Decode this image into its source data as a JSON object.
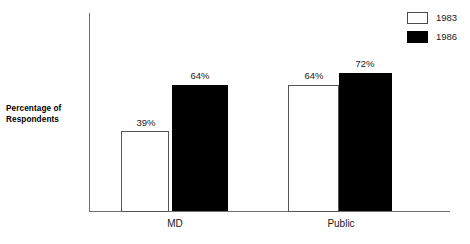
{
  "chart_data": {
    "type": "bar",
    "title": "",
    "subtitle": "",
    "xlabel": "",
    "ylabel": "Percentage of Respondents",
    "ylabel_line1": "Percentage of",
    "ylabel_line2": "Respondents",
    "categories": [
      "MD",
      "Public"
    ],
    "series": [
      {
        "name": "1983",
        "values": [
          39,
          64
        ],
        "value_labels": [
          "39%",
          "64%"
        ],
        "color": "#ffffff",
        "border_color": "#555555"
      },
      {
        "name": "1986",
        "values": [
          64,
          72
        ],
        "value_labels": [
          "64%",
          "72%"
        ],
        "color": "#000000",
        "border_color": "#000000"
      }
    ],
    "ylim": [
      0,
      100
    ],
    "grid": false,
    "legend_position": "top-right",
    "value_label_suffix": "%"
  },
  "axis": {
    "y_axis_name": "y-axis-line",
    "x_axis_name": "x-axis-line"
  },
  "legend": {
    "items": [
      {
        "label": "1983",
        "swatch": "legend-swatch-1983",
        "style": "light"
      },
      {
        "label": "1986",
        "swatch": "legend-swatch-1986",
        "style": "dark"
      }
    ]
  }
}
